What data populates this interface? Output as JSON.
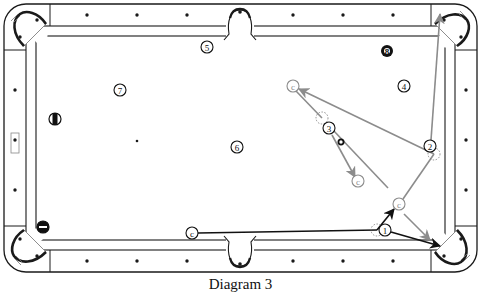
{
  "caption": "Diagram 3",
  "colors": {
    "line": "#1a1a1a",
    "path_gray": "#8c8c8c",
    "path_black": "#111111",
    "background": "#ffffff"
  },
  "table": {
    "outer": {
      "x": 4,
      "y": 4,
      "w": 473,
      "h": 268,
      "r": 22
    },
    "cushion": {
      "x": 26,
      "y": 26,
      "w": 429,
      "h": 224
    },
    "surface": {
      "x": 36,
      "y": 36,
      "w": 409,
      "h": 204
    },
    "diamonds_top": [
      87,
      137,
      187,
      293,
      343,
      393
    ],
    "diamonds_bottom": [
      87,
      137,
      187,
      293,
      343,
      393
    ],
    "diamonds_left": [
      90,
      140,
      190
    ],
    "diamonds_right": [
      90,
      140,
      190
    ],
    "spot_dots": [
      {
        "x": 137,
        "y": 141
      }
    ]
  },
  "balls": [
    {
      "id": "ball-1",
      "label": "1",
      "x": 385,
      "y": 230,
      "style": "solid"
    },
    {
      "id": "ball-2",
      "label": "2",
      "x": 430,
      "y": 146,
      "style": "solid"
    },
    {
      "id": "ball-3",
      "label": "3",
      "x": 329,
      "y": 128,
      "style": "solid"
    },
    {
      "id": "ball-4",
      "label": "4",
      "x": 404,
      "y": 86,
      "style": "solid"
    },
    {
      "id": "ball-5",
      "label": "5",
      "x": 207,
      "y": 47,
      "style": "solid"
    },
    {
      "id": "ball-6",
      "label": "6",
      "x": 237,
      "y": 147,
      "style": "solid"
    },
    {
      "id": "ball-7",
      "label": "7",
      "x": 120,
      "y": 90,
      "style": "solid"
    },
    {
      "id": "ball-8",
      "label": "8",
      "x": 387,
      "y": 51,
      "style": "black"
    },
    {
      "id": "ball-stripe",
      "label": "",
      "x": 55,
      "y": 119,
      "style": "stripe-vertical"
    },
    {
      "id": "ball-stripe-2",
      "label": "",
      "x": 43,
      "y": 227,
      "style": "stripe-horizontal"
    }
  ],
  "cue_balls": [
    {
      "id": "cue-start",
      "label": "c",
      "x": 192,
      "y": 233,
      "color": "#111111"
    },
    {
      "id": "cue-after-1",
      "label": "c",
      "x": 399,
      "y": 204,
      "color": "#8c8c8c"
    },
    {
      "id": "cue-after-2",
      "label": "c",
      "x": 293,
      "y": 86,
      "color": "#8c8c8c"
    },
    {
      "id": "cue-after-3",
      "label": "c",
      "x": 358,
      "y": 181,
      "color": "#8c8c8c"
    }
  ],
  "ghost_balls": [
    {
      "x": 377,
      "y": 230
    },
    {
      "x": 434,
      "y": 154
    },
    {
      "x": 322,
      "y": 118
    }
  ],
  "small_marker": {
    "x": 341,
    "y": 142
  },
  "paths": [
    {
      "id": "cue-to-ghost1",
      "color": "#111111",
      "points": [
        [
          198,
          233
        ],
        [
          377,
          230
        ]
      ],
      "arrow": false
    },
    {
      "id": "cue-deflect-1",
      "color": "#111111",
      "points": [
        [
          377,
          230
        ],
        [
          394,
          209
        ]
      ],
      "arrow": true
    },
    {
      "id": "ball1-to-pocket",
      "color": "#111111",
      "points": [
        [
          391,
          232
        ],
        [
          440,
          246
        ]
      ],
      "arrow": true
    },
    {
      "id": "cue-after-1-tangent",
      "color": "#8c8c8c",
      "points": [
        [
          404,
          214
        ],
        [
          430,
          240
        ]
      ],
      "arrow": true
    },
    {
      "id": "cue-to-ghost2",
      "color": "#8c8c8c",
      "points": [
        [
          403,
          199
        ],
        [
          434,
          154
        ]
      ],
      "arrow": false
    },
    {
      "id": "ball2-to-pocket",
      "color": "#8c8c8c",
      "points": [
        [
          431,
          140
        ],
        [
          440,
          14
        ]
      ],
      "arrow": true
    },
    {
      "id": "cue-ghost2-to-c",
      "color": "#8c8c8c",
      "points": [
        [
          434,
          154
        ],
        [
          299,
          89
        ]
      ],
      "arrow": true
    },
    {
      "id": "cue-c-to-ghost3",
      "color": "#8c8c8c",
      "points": [
        [
          296,
          91
        ],
        [
          322,
          118
        ]
      ],
      "arrow": false
    },
    {
      "id": "ball3-path",
      "color": "#8c8c8c",
      "points": [
        [
          332,
          135
        ],
        [
          355,
          177
        ]
      ],
      "arrow": true
    },
    {
      "id": "cue-ghost3-tangent",
      "color": "#8c8c8c",
      "points": [
        [
          333,
          130
        ],
        [
          388,
          188
        ]
      ],
      "arrow": false
    }
  ]
}
